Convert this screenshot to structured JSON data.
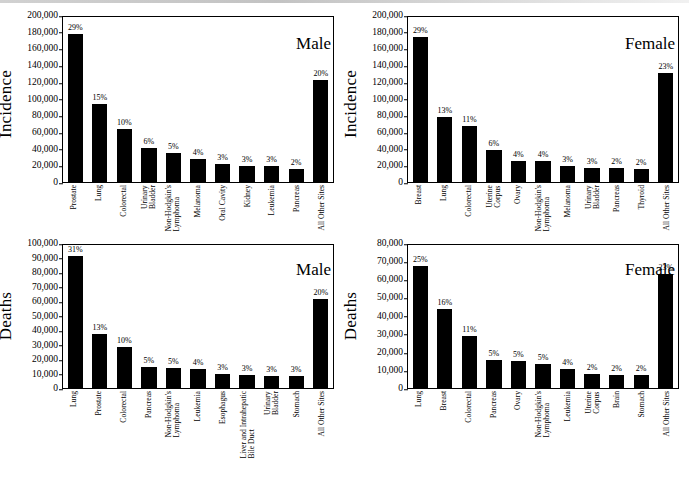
{
  "figure": {
    "bar_color": "#000000",
    "background": "#ffffff",
    "axis_color": "#000000"
  },
  "chart_data": [
    {
      "id": "male-incidence",
      "type": "bar",
      "title": "Male",
      "ylabel": "Incidence",
      "xlabel": "",
      "ylim": [
        0,
        200000
      ],
      "ytick_step": 20000,
      "yticks": [
        "0",
        "20,000",
        "40,000",
        "60,000",
        "80,000",
        "100,000",
        "120,000",
        "140,000",
        "160,000",
        "180,000",
        "200,000"
      ],
      "grid": false,
      "legend": "none",
      "categories": [
        "Prostate",
        "Lung",
        "Colorectal",
        "Urinary Bladder",
        "Non-Hodgkin's Lymphoma",
        "Melanoma",
        "Oral Cavity",
        "Kidney",
        "Leukemia",
        "Pancreas",
        "All Other Sites"
      ],
      "category_lines": [
        [
          "Prostate"
        ],
        [
          "Lung"
        ],
        [
          "Colorectal"
        ],
        [
          "Urinary",
          "Bladder"
        ],
        [
          "Non-Hodgkin's",
          "Lymphoma"
        ],
        [
          "Melanoma"
        ],
        [
          "Oral Cavity"
        ],
        [
          "Kidney"
        ],
        [
          "Leukemia"
        ],
        [
          "Pancreas"
        ],
        [
          "All Other Sites"
        ]
      ],
      "values": [
        180000,
        95000,
        64000,
        41000,
        35000,
        28000,
        22000,
        20000,
        19000,
        16000,
        124000
      ],
      "data_labels": [
        "29%",
        "15%",
        "10%",
        "6%",
        "5%",
        "4%",
        "3%",
        "3%",
        "3%",
        "2%",
        "20%"
      ]
    },
    {
      "id": "female-incidence",
      "type": "bar",
      "title": "Female",
      "ylabel": "Incidence",
      "xlabel": "",
      "ylim": [
        0,
        200000
      ],
      "ytick_step": 20000,
      "yticks": [
        "0",
        "20,000",
        "40,000",
        "60,000",
        "80,000",
        "100,000",
        "120,000",
        "140,000",
        "160,000",
        "180,000",
        "200,000"
      ],
      "grid": false,
      "legend": "none",
      "categories": [
        "Breast",
        "Lung",
        "Colorectal",
        "Uterine Corpus",
        "Ovary",
        "Non-Hodgkin's Lymphoma",
        "Melanoma",
        "Urinary Bladder",
        "Pancreas",
        "Thyroid",
        "All Other Sites"
      ],
      "category_lines": [
        [
          "Breast"
        ],
        [
          "Lung"
        ],
        [
          "Colorectal"
        ],
        [
          "Uterine",
          "Corpus"
        ],
        [
          "Ovary"
        ],
        [
          "Non-Hodgkin's",
          "Lymphoma"
        ],
        [
          "Melanoma"
        ],
        [
          "Urinary",
          "Bladder"
        ],
        [
          "Pancreas"
        ],
        [
          "Thyroid"
        ],
        [
          "All Other Sites"
        ]
      ],
      "values": [
        176000,
        79000,
        68000,
        39000,
        26000,
        25000,
        19000,
        17000,
        17000,
        16000,
        132000
      ],
      "data_labels": [
        "29%",
        "13%",
        "11%",
        "6%",
        "4%",
        "4%",
        "3%",
        "3%",
        "2%",
        "2%",
        "23%"
      ]
    },
    {
      "id": "male-deaths",
      "type": "bar",
      "title": "Male",
      "ylabel": "Deaths",
      "xlabel": "",
      "ylim": [
        0,
        100000
      ],
      "ytick_step": 10000,
      "yticks": [
        "0",
        "10,000",
        "20,000",
        "30,000",
        "40,000",
        "50,000",
        "60,000",
        "70,000",
        "80,000",
        "90,000",
        "100,000"
      ],
      "grid": false,
      "legend": "none",
      "categories": [
        "Lung",
        "Prostate",
        "Colorectal",
        "Pancreas",
        "Non-Hodgkin's Lymphoma",
        "Leukemia",
        "Esophagus",
        "Liver and Intrahepatic Bile Duct",
        "Urinary Bladder",
        "Stomach",
        "All Other Sites"
      ],
      "category_lines": [
        [
          "Lung"
        ],
        [
          "Prostate"
        ],
        [
          "Colorectal"
        ],
        [
          "Pancreas"
        ],
        [
          "Non-Hodgkin's",
          "Lymphoma"
        ],
        [
          "Leukemia"
        ],
        [
          "Esophagus"
        ],
        [
          "Liver and Intrahepatic",
          "Bile Duct"
        ],
        [
          "Urinary",
          "Bladder"
        ],
        [
          "Stomach"
        ],
        [
          "All Other Sites"
        ]
      ],
      "values": [
        92000,
        37500,
        28500,
        14500,
        14000,
        13000,
        10000,
        9200,
        8700,
        8500,
        62000
      ],
      "data_labels": [
        "31%",
        "13%",
        "10%",
        "5%",
        "5%",
        "4%",
        "3%",
        "3%",
        "3%",
        "3%",
        "20%"
      ]
    },
    {
      "id": "female-deaths",
      "type": "bar",
      "title": "Female",
      "ylabel": "Deaths",
      "xlabel": "",
      "ylim": [
        0,
        80000
      ],
      "ytick_step": 10000,
      "yticks": [
        "0",
        "10,000",
        "20,000",
        "30,000",
        "40,000",
        "50,000",
        "60,000",
        "70,000",
        "80,000"
      ],
      "grid": false,
      "legend": "none",
      "categories": [
        "Lung",
        "Breast",
        "Colorectal",
        "Pancreas",
        "Ovary",
        "Non-Hodgkin's Lymphoma",
        "Leukemia",
        "Uterine Corpus",
        "Brain",
        "Stomach",
        "All Other Sites"
      ],
      "category_lines": [
        [
          "Lung"
        ],
        [
          "Breast"
        ],
        [
          "Colorectal"
        ],
        [
          "Pancreas"
        ],
        [
          "Ovary"
        ],
        [
          "Non-Hodgkin's",
          "Lymphoma"
        ],
        [
          "Leukemia"
        ],
        [
          "Uterine",
          "Corpus"
        ],
        [
          "Brain"
        ],
        [
          "Stomach"
        ],
        [
          "All Other Sites"
        ]
      ],
      "values": [
        68000,
        44000,
        29000,
        15500,
        15200,
        13500,
        10800,
        7800,
        7400,
        7100,
        64000
      ],
      "data_labels": [
        "25%",
        "16%",
        "11%",
        "5%",
        "5%",
        "5%",
        "4%",
        "2%",
        "2%",
        "2%",
        "23%"
      ]
    }
  ]
}
